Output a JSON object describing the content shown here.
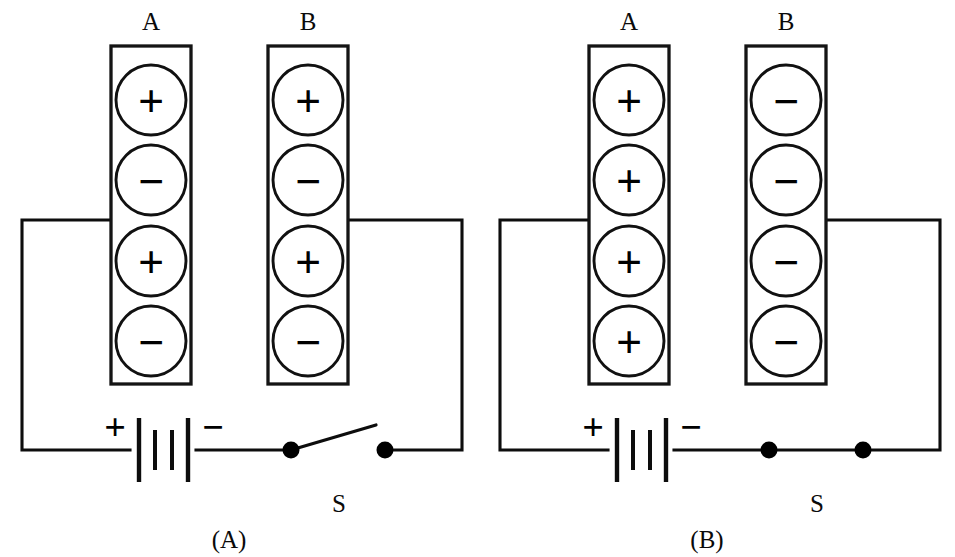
{
  "figure": {
    "background_color": "#ffffff",
    "ink_color": "#0d0d0d",
    "panel_count": 2
  },
  "panels": [
    {
      "caption": "(A)",
      "switch_label": "S",
      "switch_state": "open",
      "battery": {
        "positive_sign": "+",
        "negative_sign": "−"
      },
      "plates": [
        {
          "label": "A",
          "charges": [
            "+",
            "−",
            "+",
            "−"
          ]
        },
        {
          "label": "B",
          "charges": [
            "+",
            "−",
            "+",
            "−"
          ]
        }
      ]
    },
    {
      "caption": "(B)",
      "switch_label": "S",
      "switch_state": "closed",
      "battery": {
        "positive_sign": "+",
        "negative_sign": "−"
      },
      "plates": [
        {
          "label": "A",
          "charges": [
            "+",
            "+",
            "+",
            "+"
          ]
        },
        {
          "label": "B",
          "charges": [
            "−",
            "−",
            "−",
            "−"
          ]
        }
      ]
    }
  ],
  "geometry": {
    "panel_width": 477,
    "panel_height": 557,
    "plate_a_x": 111,
    "plate_b_x": 268,
    "plate_y": 46,
    "plate_w": 80,
    "plate_h": 338,
    "label_y": 28,
    "circle_cx_offset": 40,
    "circle_r": 35,
    "circle_cys": [
      100,
      180,
      261,
      341
    ],
    "wire_left_x": 22,
    "wire_right_x": 462,
    "wire_top_y": 220,
    "wire_bottom_y": 450,
    "battery_center_x": 163,
    "switch_left_x": 291,
    "switch_right_x": 385,
    "switch_label_y": 512,
    "caption_y": 548
  }
}
